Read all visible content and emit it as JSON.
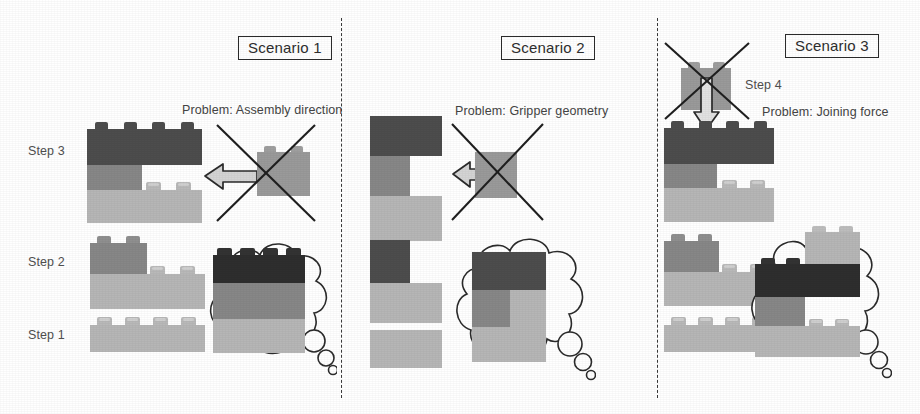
{
  "figure": {
    "background": "#ffffff",
    "colors": {
      "brick_dark": "#4d4d4d",
      "brick_medium": "#878787",
      "brick_light": "#b6b6b6",
      "brick_black": "#2e2e2e",
      "gripper_block": "#9a9a9a",
      "outline": "#2b2b2b",
      "text": "#444444"
    }
  },
  "scenarios": [
    {
      "id": "scenario-1",
      "title": "Scenario 1",
      "problem": "Problem: Assembly direction",
      "steps": [
        {
          "label": "Step 3"
        },
        {
          "label": "Step 2"
        },
        {
          "label": "Step 1"
        }
      ],
      "arrow_direction": "left",
      "rejected": true,
      "thought_bubble": "target assembly: three stacked bricks (black, medium, light)"
    },
    {
      "id": "scenario-2",
      "title": "Scenario 2",
      "problem": "Problem: Gripper geometry",
      "steps": [],
      "arrow_direction": "left",
      "rejected": true,
      "thought_bubble": "target assembly: stepped stack of dark, medium and light bricks"
    },
    {
      "id": "scenario-3",
      "title": "Scenario 3",
      "problem": "Problem: Joining force",
      "steps": [
        {
          "label": "Step 4"
        }
      ],
      "arrow_direction": "down",
      "rejected": true,
      "thought_bubble": "target assembly: interlocked bricks with overhanging black brick"
    }
  ],
  "dividers": [
    {
      "name": "divider-1-2"
    },
    {
      "name": "divider-2-3"
    }
  ]
}
